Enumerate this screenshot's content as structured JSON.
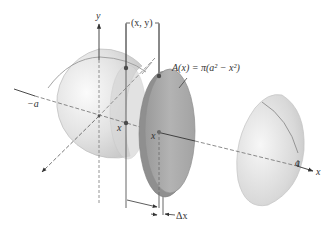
{
  "figure": {
    "labels": {
      "y_axis": "y",
      "x_axis": "x",
      "point": "(x, y)",
      "area_formula": "A(x) = π(a² − x²)",
      "neg_a": "−a",
      "pos_a": "a",
      "x_marker_left": "x",
      "x_marker_right": "x",
      "delta_x": "Δx"
    },
    "colors": {
      "sphere_fill": "#e4e4e4",
      "sphere_edge": "#bdbdbd",
      "disc_fill": "#a9a9a9",
      "disc_edge": "#8a8a8a",
      "cap_fill": "#dcdcdc",
      "axis": "#333333",
      "dashed": "#6f6f6f",
      "point": "#4a4a4a"
    }
  }
}
